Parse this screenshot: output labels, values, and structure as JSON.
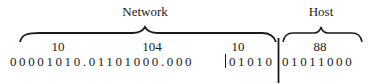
{
  "labels": {
    "network": "Network",
    "host": "Host"
  },
  "octets_decimal": [
    "10",
    "104",
    "10",
    "88"
  ],
  "binary": {
    "part1": "00001010.01101000.000",
    "part2": "01010",
    "part3": "01011000"
  },
  "colors": {
    "ink": "#1a1a1a",
    "background": "#ffffff"
  }
}
